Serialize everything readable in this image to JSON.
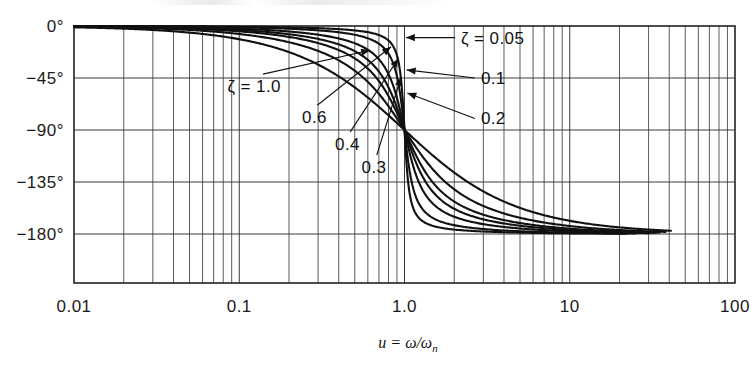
{
  "figure": {
    "kind": "bode-phase-plot",
    "xaxis_label": "u = ω/ωn",
    "xaxis_label_parts": {
      "var": "u",
      "equals": "=",
      "num": "ω",
      "slash": "/",
      "den": "ω",
      "sub": "n"
    }
  },
  "chart_data": {
    "type": "line",
    "title": "",
    "subtitle": "",
    "xlabel": "u = ω/ωn",
    "ylabel": "",
    "xscale": "log",
    "xlim": [
      0.01,
      100
    ],
    "ylim": [
      -202.5,
      22.5
    ],
    "grid": true,
    "legend_position": "inline-annotations",
    "xticks": [
      {
        "value": 0.01,
        "label": "0.01"
      },
      {
        "value": 0.1,
        "label": "0.1"
      },
      {
        "value": 1.0,
        "label": "1.0"
      },
      {
        "value": 10,
        "label": "10"
      },
      {
        "value": 100,
        "label": "100"
      }
    ],
    "yticks": [
      {
        "value": 0,
        "label": "0°"
      },
      {
        "value": -45,
        "label": "−45°"
      },
      {
        "value": -90,
        "label": "−90°"
      },
      {
        "value": -135,
        "label": "−135°"
      },
      {
        "value": -180,
        "label": "−180°"
      }
    ],
    "annotations": [
      {
        "label": "ζ = 1.0",
        "zeta": 1.0,
        "text_x": 0.085,
        "text_y": -52,
        "tip_x": 0.62,
        "tip_y": -21,
        "side": "left"
      },
      {
        "label": "0.6",
        "zeta": 0.6,
        "text_x": 0.24,
        "text_y": -79,
        "tip_x": 0.83,
        "tip_y": -18,
        "side": "left"
      },
      {
        "label": "0.4",
        "zeta": 0.4,
        "text_x": 0.38,
        "text_y": -102,
        "tip_x": 0.92,
        "tip_y": -28,
        "side": "left"
      },
      {
        "label": "0.3",
        "zeta": 0.3,
        "text_x": 0.55,
        "text_y": -122,
        "tip_x": 0.955,
        "tip_y": -44,
        "side": "left"
      },
      {
        "label": "ζ = 0.05",
        "zeta": 0.05,
        "text_x": 2.2,
        "text_y": -10,
        "tip_x": 1.02,
        "tip_y": -10,
        "side": "right"
      },
      {
        "label": "0.1",
        "zeta": 0.1,
        "text_x": 2.9,
        "text_y": -45,
        "tip_x": 1.03,
        "tip_y": -38,
        "side": "right"
      },
      {
        "label": "0.2",
        "zeta": 0.2,
        "text_x": 2.9,
        "text_y": -80,
        "tip_x": 1.04,
        "tip_y": -58,
        "side": "right"
      }
    ],
    "series": [
      {
        "name": "ζ = 0.05",
        "zeta": 0.05,
        "u_end": 22,
        "u": [
          0.01,
          0.02,
          0.05,
          0.1,
          0.2,
          0.3,
          0.4,
          0.5,
          0.6,
          0.7,
          0.8,
          0.9,
          0.95,
          0.98,
          1.0,
          1.02,
          1.05,
          1.1,
          1.2,
          1.4,
          1.7,
          2.0,
          3.0,
          5.0,
          10.0,
          22.0
        ],
        "phase": [
          -0.06,
          -0.11,
          -0.29,
          -0.58,
          -1.19,
          -1.89,
          -2.72,
          -3.81,
          -5.36,
          -7.82,
          -12.5,
          -26.6,
          -45.4,
          -68.5,
          -90.0,
          -110.3,
          -135.5,
          -155.4,
          -167.2,
          -174.1,
          -177.0,
          -178.1,
          -179.3,
          -179.8,
          -179.9,
          -179.96
        ]
      },
      {
        "name": "ζ = 0.1",
        "zeta": 0.1,
        "u_end": 25,
        "u": [
          0.01,
          0.02,
          0.05,
          0.1,
          0.2,
          0.3,
          0.4,
          0.5,
          0.6,
          0.7,
          0.8,
          0.9,
          0.95,
          0.98,
          1.0,
          1.02,
          1.05,
          1.1,
          1.2,
          1.4,
          1.7,
          2.0,
          3.0,
          5.0,
          10.0,
          25.0
        ],
        "phase": [
          -0.11,
          -0.23,
          -0.57,
          -1.16,
          -2.39,
          -3.78,
          -5.44,
          -7.59,
          -10.6,
          -15.3,
          -23.9,
          -43.4,
          -62.8,
          -78.7,
          -90.0,
          -100.4,
          -115.8,
          -137.0,
          -155.2,
          -167.4,
          -173.9,
          -176.2,
          -178.6,
          -179.5,
          -179.9,
          -179.95
        ]
      },
      {
        "name": "ζ = 0.2",
        "zeta": 0.2,
        "u_end": 30,
        "u": [
          0.01,
          0.02,
          0.05,
          0.1,
          0.2,
          0.3,
          0.4,
          0.5,
          0.6,
          0.7,
          0.8,
          0.9,
          0.95,
          0.98,
          1.0,
          1.02,
          1.05,
          1.1,
          1.2,
          1.4,
          1.7,
          2.0,
          3.0,
          5.0,
          10.0,
          30.0
        ],
        "phase": [
          -0.23,
          -0.46,
          -1.15,
          -2.31,
          -4.76,
          -7.54,
          -10.8,
          -14.9,
          -20.6,
          -29.1,
          -41.6,
          -61.5,
          -74.7,
          -83.9,
          -90.0,
          -96.0,
          -105.5,
          -122.2,
          -144.4,
          -162.1,
          -170.8,
          -174.2,
          -178.0,
          -179.2,
          -179.8,
          -179.9
        ]
      },
      {
        "name": "ζ = 0.3",
        "zeta": 0.3,
        "u_end": 33,
        "u": [
          0.01,
          0.02,
          0.05,
          0.1,
          0.2,
          0.3,
          0.4,
          0.5,
          0.6,
          0.7,
          0.8,
          0.9,
          0.95,
          0.98,
          1.0,
          1.02,
          1.05,
          1.1,
          1.2,
          1.4,
          1.7,
          2.0,
          3.0,
          5.0,
          10.0,
          33.0
        ],
        "phase": [
          -0.34,
          -0.69,
          -1.72,
          -3.47,
          -7.13,
          -11.3,
          -16.3,
          -22.4,
          -30.3,
          -41.0,
          -55.4,
          -71.6,
          -79.9,
          -85.6,
          -90.0,
          -94.1,
          -100.6,
          -113.7,
          -135.3,
          -157.3,
          -168.2,
          -172.9,
          -177.1,
          -178.8,
          -179.7,
          -179.9
        ]
      },
      {
        "name": "ζ = 0.4",
        "zeta": 0.4,
        "u_end": 35,
        "u": [
          0.01,
          0.02,
          0.05,
          0.1,
          0.2,
          0.3,
          0.4,
          0.5,
          0.6,
          0.7,
          0.8,
          0.9,
          0.95,
          0.98,
          1.0,
          1.02,
          1.05,
          1.1,
          1.2,
          1.4,
          1.7,
          2.0,
          3.0,
          5.0,
          10.0,
          35.0
        ],
        "phase": [
          -0.46,
          -0.92,
          -2.29,
          -4.62,
          -9.46,
          -15.0,
          -21.4,
          -29.1,
          -38.7,
          -50.5,
          -64.3,
          -78.0,
          -84.4,
          -88.3,
          -90.0,
          -92.8,
          -98.0,
          -109.4,
          -130.1,
          -154.4,
          -166.6,
          -171.9,
          -176.6,
          -178.4,
          -179.6,
          -179.9
        ]
      },
      {
        "name": "ζ = 0.6",
        "zeta": 0.6,
        "u_end": 38,
        "u": [
          0.01,
          0.02,
          0.05,
          0.1,
          0.2,
          0.3,
          0.4,
          0.5,
          0.6,
          0.7,
          0.8,
          0.9,
          0.95,
          0.98,
          1.0,
          1.02,
          1.05,
          1.1,
          1.2,
          1.4,
          1.7,
          2.0,
          3.0,
          5.0,
          10.0,
          38.0
        ],
        "phase": [
          -0.69,
          -1.38,
          -3.44,
          -6.92,
          -14.0,
          -22.0,
          -31.0,
          -41.0,
          -51.6,
          -62.3,
          -72.3,
          -81.4,
          -85.6,
          -87.8,
          -90.0,
          -91.5,
          -94.5,
          -102.3,
          -121.2,
          -148.5,
          -163.6,
          -170.1,
          -175.8,
          -178.1,
          -179.5,
          -179.9
        ]
      },
      {
        "name": "ζ = 1.0",
        "zeta": 1.0,
        "u_end": 41,
        "u": [
          0.01,
          0.02,
          0.05,
          0.1,
          0.2,
          0.3,
          0.4,
          0.5,
          0.6,
          0.7,
          0.8,
          0.9,
          0.95,
          0.98,
          1.0,
          1.02,
          1.05,
          1.1,
          1.2,
          1.4,
          1.7,
          2.0,
          3.0,
          5.0,
          10.0,
          41.0
        ],
        "phase": [
          -1.15,
          -2.29,
          -5.72,
          -11.4,
          -22.6,
          -33.4,
          -43.6,
          -53.1,
          -61.6,
          -69.1,
          -75.8,
          -81.6,
          -84.3,
          -85.8,
          -90.0,
          -88.0,
          -89.4,
          -93.0,
          -103.6,
          -130.3,
          -154.2,
          -163.7,
          -173.4,
          -177.2,
          -179.0,
          -179.6
        ]
      }
    ]
  }
}
